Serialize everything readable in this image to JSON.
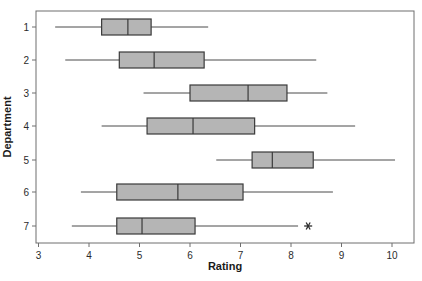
{
  "chart_data": {
    "type": "box",
    "orientation": "horizontal",
    "title": "",
    "xlabel": "Rating",
    "ylabel": "Department",
    "xlim": [
      2.95,
      10.45
    ],
    "ylim_categories": [
      "1",
      "2",
      "3",
      "4",
      "5",
      "6",
      "7"
    ],
    "xticks": [
      3,
      4,
      5,
      6,
      7,
      8,
      9,
      10
    ],
    "xtick_labels": [
      "3",
      "4",
      "5",
      "6",
      "7",
      "8",
      "9",
      "10"
    ],
    "yticks": [
      1,
      2,
      3,
      4,
      5,
      6,
      7
    ],
    "ytick_labels": [
      "1",
      "2",
      "3",
      "4",
      "5",
      "6",
      "7"
    ],
    "grid": false,
    "legend": false,
    "box_fill_color": "#b5b5b5",
    "box_edge_color": "#3a3a3a",
    "whisker_color": "#4a4a4a",
    "frame_color": "#6e6e6e",
    "outlier_marker": "asterisk",
    "boxes": [
      {
        "category": "1",
        "whisker_low": 3.33,
        "q1": 4.25,
        "median": 4.77,
        "q3": 5.23,
        "whisker_high": 6.36,
        "outliers": []
      },
      {
        "category": "2",
        "whisker_low": 3.53,
        "q1": 4.6,
        "median": 5.29,
        "q3": 6.28,
        "whisker_high": 8.5,
        "outliers": []
      },
      {
        "category": "3",
        "whisker_low": 5.08,
        "q1": 6.0,
        "median": 7.15,
        "q3": 7.92,
        "whisker_high": 8.72,
        "outliers": []
      },
      {
        "category": "4",
        "whisker_low": 4.25,
        "q1": 5.15,
        "median": 6.06,
        "q3": 7.28,
        "whisker_high": 9.27,
        "outliers": []
      },
      {
        "category": "5",
        "whisker_low": 6.52,
        "q1": 7.23,
        "median": 7.63,
        "q3": 8.44,
        "whisker_high": 10.06,
        "outliers": []
      },
      {
        "category": "6",
        "whisker_low": 3.84,
        "q1": 4.55,
        "median": 5.76,
        "q3": 7.05,
        "whisker_high": 8.83,
        "outliers": []
      },
      {
        "category": "7",
        "whisker_low": 3.66,
        "q1": 4.55,
        "median": 5.05,
        "q3": 6.1,
        "whisker_high": 8.14,
        "outliers": [
          8.34
        ]
      }
    ]
  }
}
